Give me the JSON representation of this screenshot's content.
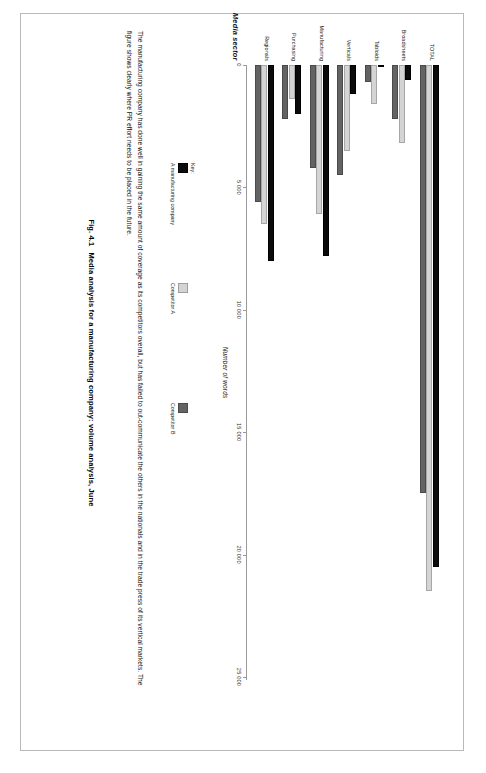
{
  "figure": {
    "caption_number": "Fig. 4.1",
    "caption_text": "Media analysis for a manufacturing company: volume analysis, June",
    "body_text": "The manufacturing company has done well in gaining the same amount of coverage as its competitors overall, but has failed to out-communicate the others in the nationals and in the trade press of its vertical markets. The figure shows clearly where PR effort needs to be placed in the future.",
    "key_word": "Key:"
  },
  "chart_data": {
    "type": "bar",
    "orientation": "horizontal",
    "title": "",
    "xlabel": "Media sector",
    "ylabel": "Number of words",
    "categories": [
      "TOTAL",
      "Broadsheets",
      "Tabloids",
      "Verticals",
      "Manufacturing",
      "Purchasing",
      "Regionals"
    ],
    "series": [
      {
        "name": "A manufacturing company",
        "color": "#0b0b0b",
        "values": [
          20500,
          600,
          0,
          1200,
          7800,
          2000,
          8000
        ]
      },
      {
        "name": "Competitor A",
        "color": "#d4d4d4",
        "values": [
          21500,
          3200,
          1600,
          3500,
          6100,
          1400,
          6500
        ]
      },
      {
        "name": "Competitor B",
        "color": "#636363",
        "values": [
          17500,
          2200,
          700,
          4500,
          4200,
          2200,
          5600
        ]
      }
    ],
    "ylim": [
      0,
      25000
    ],
    "ticks": [
      0,
      5000,
      10000,
      15000,
      20000,
      25000
    ],
    "tick_labels": [
      "0",
      "5 000",
      "10 000",
      "15 000",
      "20 000",
      "25 000"
    ],
    "grid": false,
    "legend_position": "below-left"
  }
}
